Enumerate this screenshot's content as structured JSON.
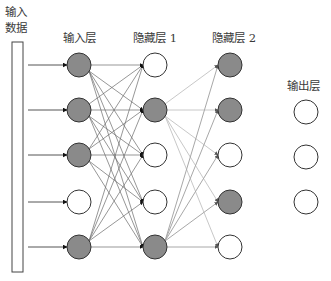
{
  "labels": {
    "input_data_line1": "输入",
    "input_data_line2": "数据",
    "input_layer": "输入层",
    "hidden_layer_1": "隐藏层 1",
    "hidden_layer_2": "隐藏层 2",
    "output_layer": "输出层"
  },
  "colors": {
    "active_fill": "#8a8a8a",
    "inactive_fill": "#ffffff",
    "node_stroke": "#333333",
    "edge_input_hidden1": "#6a6a6a",
    "edge_hidden1_hidden2": "#c8c8c8",
    "edge_hidden1_node5": "#a8a8a8"
  },
  "layers": {
    "input": {
      "label": "输入层",
      "nodes": [
        "active",
        "active",
        "active",
        "inactive",
        "active"
      ]
    },
    "hidden1": {
      "label": "隐藏层 1",
      "nodes": [
        "inactive",
        "active",
        "inactive",
        "inactive",
        "active"
      ]
    },
    "hidden2": {
      "label": "隐藏层 2",
      "nodes": [
        "active",
        "active",
        "inactive",
        "active",
        "inactive"
      ]
    },
    "output": {
      "label": "输出层",
      "nodes": [
        "inactive",
        "inactive",
        "inactive"
      ]
    }
  }
}
